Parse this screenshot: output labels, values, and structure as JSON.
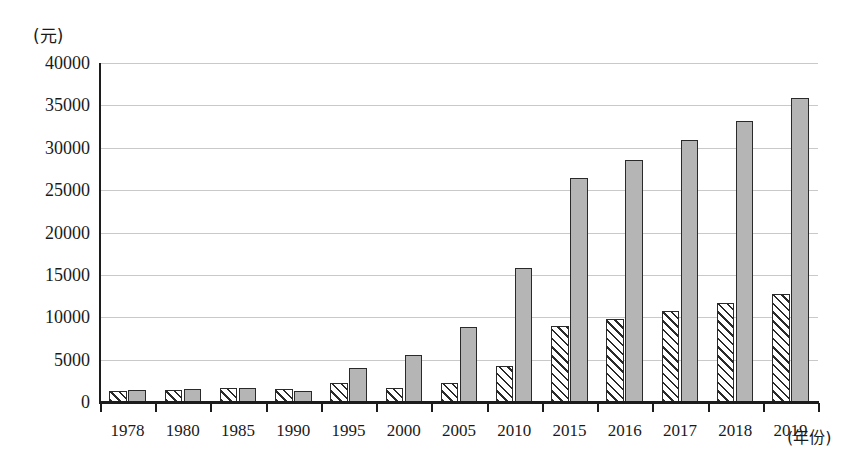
{
  "chart_data": {
    "type": "bar",
    "title": "",
    "subtitle": "",
    "xlabel": "(年份)",
    "ylabel": "(元)",
    "categories": [
      "1978",
      "1980",
      "1985",
      "1990",
      "1995",
      "2000",
      "2005",
      "2010",
      "2015",
      "2016",
      "2017",
      "2018",
      "2019"
    ],
    "series": [
      {
        "name": "hatched-series",
        "style": "diagonal-hatch",
        "values": [
          1340,
          1400,
          1600,
          1500,
          2300,
          1600,
          2200,
          4300,
          9000,
          9800,
          10700,
          11700,
          12800
        ]
      },
      {
        "name": "solid-series",
        "style": "solid-gray",
        "values": [
          1430,
          1500,
          1700,
          1350,
          4000,
          5600,
          8800,
          15800,
          26400,
          28500,
          30900,
          33200,
          35900
        ]
      }
    ],
    "ylim": [
      0,
      40000
    ],
    "ytick_values": [
      0,
      5000,
      10000,
      15000,
      20000,
      25000,
      30000,
      35000,
      40000
    ],
    "ytick_labels": [
      "0",
      "5000",
      "10000",
      "15000",
      "20000",
      "25000",
      "30000",
      "35000",
      "40000"
    ],
    "grid": "horizontal",
    "legend_position": "none",
    "bar_fill_solid": "#b5b5b5",
    "bar_edge_color": "#2a2a2a",
    "gridline_color": "#c9c9c9",
    "axis_color": "#1c1c1c"
  }
}
